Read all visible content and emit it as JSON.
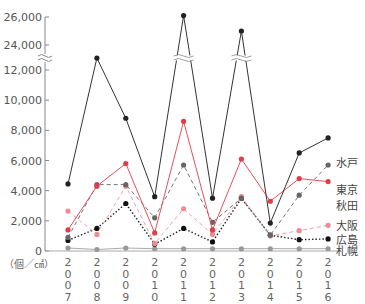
{
  "chart_data": {
    "type": "line",
    "title": "",
    "xlabel": "",
    "ylabel": "（個／㎠）",
    "unit_label": "（個／㎠）",
    "ylim": [
      0,
      26000
    ],
    "axis_break": {
      "from": 12000,
      "to": 24000
    },
    "y_ticks": [
      0,
      2000,
      4000,
      6000,
      8000,
      10000,
      12000,
      24000,
      26000
    ],
    "y_tick_labels": [
      "0",
      "2,000",
      "4,000",
      "6,000",
      "8,000",
      "10,000",
      "12,000",
      "24,000",
      "26,000"
    ],
    "categories": [
      "2007",
      "2008",
      "2009",
      "2010",
      "2011",
      "2012",
      "2013",
      "2014",
      "2015",
      "2016"
    ],
    "grid": false,
    "legend_position": "right-inline",
    "series": [
      {
        "name": "水戸",
        "style": "solid",
        "color": "#333333",
        "marker_color": "#222222",
        "values": [
          4450,
          12500,
          8800,
          3600,
          26100,
          3500,
          25000,
          1850,
          6500,
          7500
        ]
      },
      {
        "name": "東京",
        "style": "dashed",
        "color": "#777777",
        "marker_color": "#666666",
        "values": [
          900,
          4400,
          4400,
          2200,
          5700,
          1900,
          3500,
          1050,
          3700,
          5700
        ]
      },
      {
        "name": "秋田",
        "style": "solid",
        "color": "#e8505b",
        "marker_color": "#e23c4a",
        "values": [
          1400,
          4300,
          5800,
          1200,
          8600,
          1400,
          6100,
          3300,
          4800,
          4600
        ]
      },
      {
        "name": "大阪",
        "style": "dashed",
        "color": "#f2a0a8",
        "marker_color": "#ee8c96",
        "values": [
          2650,
          1100,
          4300,
          500,
          2800,
          1100,
          3600,
          1000,
          1350,
          1700
        ]
      },
      {
        "name": "広島",
        "style": "dotted",
        "color": "#222222",
        "marker_color": "#111111",
        "values": [
          700,
          1500,
          3150,
          450,
          1500,
          600,
          3500,
          1050,
          750,
          800
        ]
      },
      {
        "name": "札幌",
        "style": "solid",
        "color": "#aaaaaa",
        "marker_color": "#999999",
        "values": [
          200,
          100,
          200,
          150,
          150,
          150,
          150,
          150,
          150,
          150
        ]
      }
    ]
  }
}
